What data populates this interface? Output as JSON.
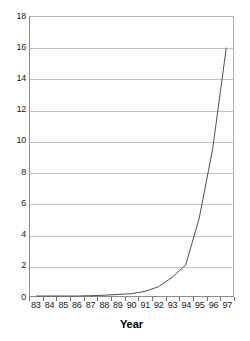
{
  "chart_data": {
    "type": "line",
    "title": "",
    "xlabel": "Year",
    "ylabel": "",
    "categories": [
      "83",
      "84",
      "85",
      "86",
      "87",
      "88",
      "89",
      "90",
      "91",
      "92",
      "93",
      "94",
      "95",
      "96",
      "97"
    ],
    "values": [
      0,
      0,
      0,
      0,
      0.02,
      0.05,
      0.1,
      0.15,
      0.3,
      0.6,
      1.2,
      2.0,
      5.0,
      9.5,
      16.0
    ],
    "series": [
      {
        "name": "",
        "values": [
          0,
          0,
          0,
          0,
          0.02,
          0.05,
          0.1,
          0.15,
          0.3,
          0.6,
          1.2,
          2.0,
          5.0,
          9.5,
          16.0
        ]
      }
    ],
    "ylim": [
      0,
      18
    ],
    "ytick_step": 2,
    "yticks": [
      0,
      2,
      4,
      6,
      8,
      10,
      12,
      14,
      16,
      18
    ],
    "ytick_labels": [
      "0",
      "2",
      "4",
      "6",
      "8",
      "10",
      "12",
      "14",
      "16",
      "18"
    ],
    "grid": "horizontal",
    "legend": "none",
    "line_color": "#4d4d4d",
    "grid_color": "#c4c4c4",
    "axis_color": "#8c8c8c",
    "background": "#ffffff"
  },
  "axis_title": {
    "text": "Year"
  }
}
